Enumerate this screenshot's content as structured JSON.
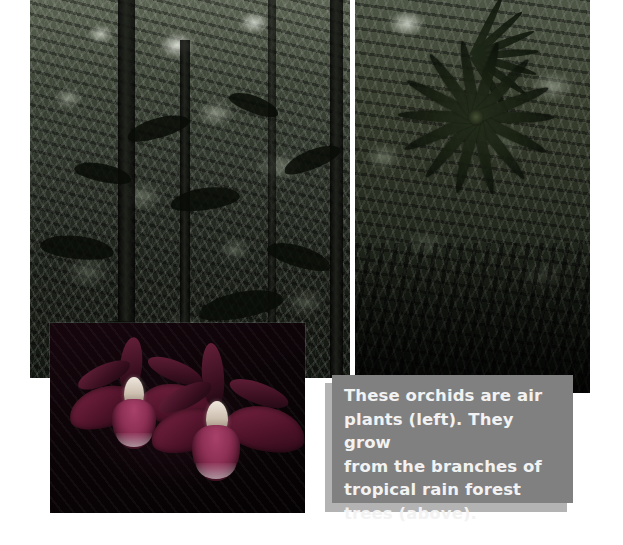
{
  "page": {
    "width": 623,
    "height": 545,
    "background_color": "#ffffff"
  },
  "caption": {
    "text": "These orchids are air\nplants (left). They grow\nfrom the branches of\ntropical rain forest\ntrees (above).",
    "lines": [
      "These orchids are air",
      "plants (left). They grow",
      "from the branches of",
      "tropical rain forest",
      "trees (above)."
    ],
    "text_color": "#f2f2f2",
    "box_color": "#808080",
    "shadow_color": "#b3b3b3"
  },
  "photos": [
    {
      "name": "rain-forest-canopy-left",
      "subject": "Tropical rain forest trees and canopy",
      "x": 30,
      "y": 0,
      "width": 320,
      "height": 378
    },
    {
      "name": "rain-forest-canopy-right",
      "subject": "Tropical rain forest palm and bromeliad rosette",
      "x": 355,
      "y": 0,
      "width": 235,
      "height": 393
    },
    {
      "name": "orchid-closeup",
      "subject": "Two orchid flowers growing as air plants",
      "x": 50,
      "y": 323,
      "width": 255,
      "height": 190
    }
  ]
}
